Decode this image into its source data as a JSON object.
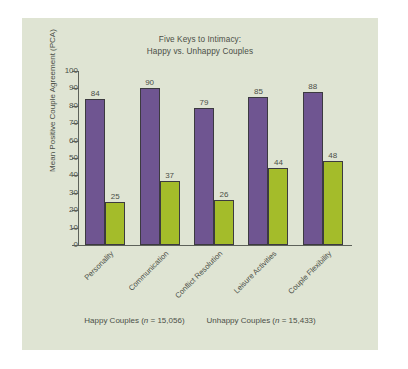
{
  "panel": {
    "background_color": "#dfe4d3",
    "outer_background_color": "#ffffff"
  },
  "chart_data": {
    "type": "bar",
    "title": "Five Keys to Intimacy:\nHappy vs. Unhappy Couples",
    "title_lines": [
      "Five Keys to Intimacy:",
      "Happy vs. Unhappy Couples"
    ],
    "categories": [
      "Personality",
      "Communication",
      "Conflict Resolution",
      "Leisure Activities",
      "Couple Flexibility"
    ],
    "series": [
      {
        "name": "Happy Couples",
        "n": "15,056",
        "legend_label": "Happy Couples (n = 15,056)",
        "color": "#6f5591",
        "values": [
          84,
          90,
          79,
          85,
          88
        ]
      },
      {
        "name": "Unhappy Couples",
        "n": "15,433",
        "legend_label": "Unhappy Couples (n = 15,433)",
        "color": "#a4bc2a",
        "values": [
          25,
          37,
          26,
          44,
          48
        ]
      }
    ],
    "xlabel": "",
    "ylabel": "Mean Positive Couple Agreement (PCA)",
    "ylim": [
      0,
      100
    ],
    "yticks": [
      0,
      10,
      20,
      30,
      40,
      50,
      60,
      70,
      80,
      90,
      100
    ],
    "grid": false,
    "legend_position": "bottom",
    "value_labels_shown": true
  }
}
